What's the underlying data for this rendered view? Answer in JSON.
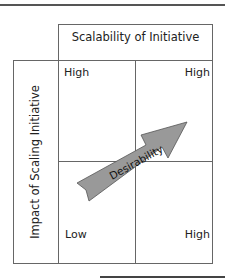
{
  "diagram": {
    "x_axis_title": "Scalability of Initiative",
    "y_axis_title": "Impact of Scaling Initiative",
    "quadrants": {
      "top_left": "High",
      "top_right": "High",
      "bottom_left": "Low",
      "bottom_right": "High"
    },
    "arrow_label": "Desirability",
    "colors": {
      "arrow_fill": "#999999",
      "arrow_stroke": "#555555",
      "grid_line": "#666666"
    }
  }
}
